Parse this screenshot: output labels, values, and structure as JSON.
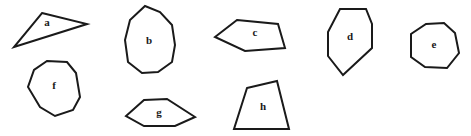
{
  "figure": {
    "background": "#ffffff",
    "stroke_color": "#1a1a1a",
    "shapes": [
      {
        "label": "a",
        "points": "42,13 87,24 14,47",
        "label_pos": [
          47,
          23
        ]
      },
      {
        "label": "b",
        "points": "145,6 160,12 172,25 175,45 172,62 158,72 142,73 128,62 125,40 130,20",
        "label_pos": [
          149,
          41
        ]
      },
      {
        "label": "c",
        "points": "237,20 278,24 285,48 245,51 215,37",
        "label_pos": [
          255,
          33
        ]
      },
      {
        "label": "d",
        "points": "340,9 366,9 372,24 372,48 343,75 328,56 328,32",
        "label_pos": [
          350,
          37
        ]
      },
      {
        "label": "e",
        "points": "426,24 444,23 455,33 459,53 447,68 425,67 411,57 411,34",
        "label_pos": [
          434,
          45
        ]
      },
      {
        "label": "f",
        "points": "47,61 67,62 76,73 80,97 73,110 55,116 40,107 28,87 34,70",
        "label_pos": [
          54,
          86
        ]
      },
      {
        "label": "g",
        "points": "144,100 167,99 195,117 175,126 144,126 126,116",
        "label_pos": [
          159,
          113
        ]
      },
      {
        "label": "h",
        "points": "247,88 277,81 289,129 234,129",
        "label_pos": [
          263,
          107
        ]
      }
    ]
  }
}
